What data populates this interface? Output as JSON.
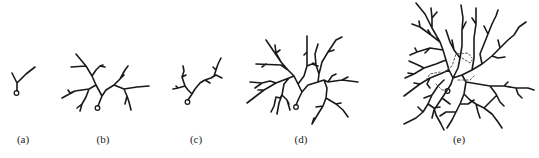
{
  "figure": {
    "panels": [
      {
        "id": "a",
        "label": "(a)",
        "label_x": 23
      },
      {
        "id": "b",
        "label": "(b)",
        "label_x": 103
      },
      {
        "id": "c",
        "label": "(c)",
        "label_x": 196
      },
      {
        "id": "d",
        "label": "(d)",
        "label_x": 301
      },
      {
        "id": "e",
        "label": "(e)",
        "label_x": 459
      }
    ],
    "colors": {
      "stroke": "#1a1a1a",
      "dashed": "#555555",
      "background": "#ffffff"
    }
  }
}
